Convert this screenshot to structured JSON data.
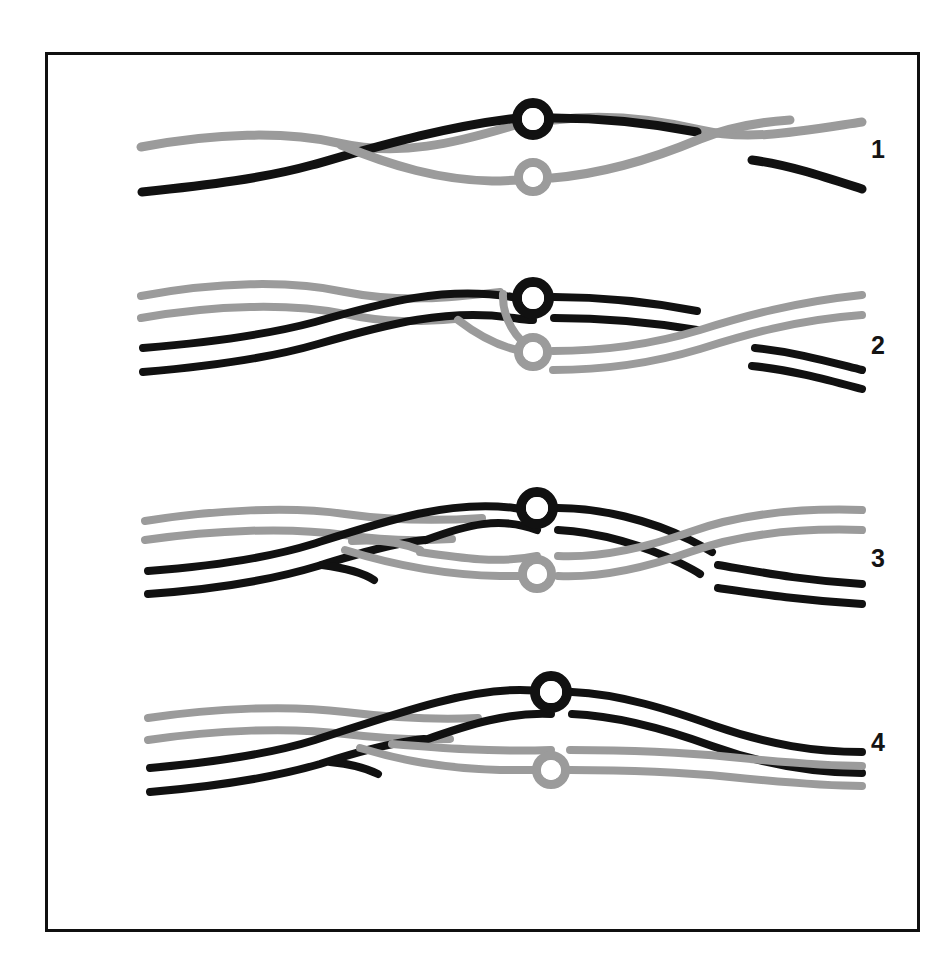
{
  "figure": {
    "background_color": "#ffffff",
    "frame": {
      "border_color": "#101010",
      "border_width_px": 3,
      "x": 45,
      "y": 52,
      "width": 875,
      "height": 880
    },
    "colors": {
      "dark_strand": "#111111",
      "light_strand": "#9b9b9b",
      "node_fill": "#ffffff",
      "label_color": "#141414"
    },
    "stroke_widths": {
      "single_strand": 9,
      "duplex_strand": 8,
      "node_ring": 9
    },
    "row_labels": [
      {
        "id": "1",
        "text": "1"
      },
      {
        "id": "2",
        "text": "2"
      },
      {
        "id": "3",
        "text": "3"
      },
      {
        "id": "4",
        "text": "4"
      }
    ],
    "nodes": [
      {
        "id": "row1-dark-node",
        "color": "dark",
        "cx": 533,
        "cy": 119,
        "r_outer": 21,
        "r_inner": 11
      },
      {
        "id": "row1-light-node",
        "color": "light",
        "cx": 533,
        "cy": 177,
        "r_outer": 19,
        "r_inner": 10
      },
      {
        "id": "row2-dark-node",
        "color": "dark",
        "cx": 533,
        "cy": 298,
        "r_outer": 21,
        "r_inner": 11
      },
      {
        "id": "row2-light-node",
        "color": "light",
        "cx": 533,
        "cy": 352,
        "r_outer": 19,
        "r_inner": 10
      },
      {
        "id": "row3-dark-node",
        "color": "dark",
        "cx": 537,
        "cy": 508,
        "r_outer": 21,
        "r_inner": 11
      },
      {
        "id": "row3-light-node",
        "color": "light",
        "cx": 537,
        "cy": 574,
        "r_outer": 19,
        "r_inner": 10
      },
      {
        "id": "row4-dark-node",
        "color": "dark",
        "cx": 551,
        "cy": 692,
        "r_outer": 21,
        "r_inner": 11
      },
      {
        "id": "row4-light-node",
        "color": "light",
        "cx": 551,
        "cy": 770,
        "r_outer": 19,
        "r_inner": 10
      }
    ],
    "rows": [
      {
        "id": "row-1",
        "label": "1",
        "description": "Two single strands cross; dark strand rises left-to-right, light strand dips; each carries one ring node; dark strand is nicked at right.",
        "paths": [
          {
            "id": "r1-light-a",
            "color": "light",
            "width": 9,
            "d": "M 141 147 C 215 133 285 131 338 143 C 400 157 455 143 512 126 C 520 124 526 122 533 121"
          },
          {
            "id": "r1-light-b",
            "color": "light",
            "width": 9,
            "d": "M 554 120 C 600 114 650 118 700 130 C 748 141 795 132 862 122"
          },
          {
            "id": "r1-dark-a",
            "color": "dark",
            "width": 9,
            "d": "M 142 192 C 210 185 265 178 312 165 C 380 146 440 128 510 119 C 518 118 526 118 533 118"
          },
          {
            "id": "r1-dark-b",
            "color": "dark",
            "width": 9,
            "d": "M 553 118 C 600 118 650 123 697 132"
          },
          {
            "id": "r1-dark-c",
            "color": "dark",
            "width": 9,
            "d": "M 752 160 C 790 165 828 178 862 189"
          },
          {
            "id": "r1-light-cross",
            "color": "light",
            "width": 9,
            "d": "M 341 145 C 392 166 440 180 492 181 C 506 181 520 180 533 179"
          },
          {
            "id": "r1-light-cross-b",
            "color": "light",
            "width": 9,
            "d": "M 552 178 C 600 174 650 160 700 139 C 730 127 760 122 790 120"
          }
        ]
      },
      {
        "id": "row-2",
        "label": "2",
        "description": "Duplex (paired) strands; dark duplex crosses over the light duplex; ring nodes on both duplexes; light duplex truncated at left, dark duplex nicked at right.",
        "paths": [
          {
            "id": "r2-light-a1",
            "color": "light",
            "width": 8,
            "d": "M 141 296 C 215 282 290 280 345 292 C 400 303 450 298 500 292"
          },
          {
            "id": "r2-light-a2",
            "color": "light",
            "width": 8,
            "d": "M 141 318 C 215 305 290 303 345 314 C 385 323 420 322 455 319"
          },
          {
            "id": "r2-dark-a1",
            "color": "dark",
            "width": 8,
            "d": "M 143 348 C 215 342 270 334 315 322 C 385 302 445 286 512 297 C 520 298 527 299 533 299"
          },
          {
            "id": "r2-dark-a2",
            "color": "dark",
            "width": 8,
            "d": "M 143 372 C 215 366 270 358 318 344 C 388 324 448 308 514 318 C 520 319 527 320 533 320"
          },
          {
            "id": "r2-dark-b1",
            "color": "dark",
            "width": 8,
            "d": "M 554 297 C 600 297 650 302 697 311"
          },
          {
            "id": "r2-dark-b2",
            "color": "dark",
            "width": 8,
            "d": "M 554 318 C 600 318 650 322 697 330"
          },
          {
            "id": "r2-dark-c1",
            "color": "dark",
            "width": 8,
            "d": "M 755 348 C 795 352 830 362 862 370"
          },
          {
            "id": "r2-dark-c2",
            "color": "dark",
            "width": 8,
            "d": "M 752 366 C 792 370 828 380 862 389"
          },
          {
            "id": "r2-light-x1",
            "color": "light",
            "width": 8,
            "d": "M 458 320 C 480 337 505 350 533 353"
          },
          {
            "id": "r2-light-x2",
            "color": "light",
            "width": 8,
            "d": "M 503 294 C 502 318 516 340 533 349"
          },
          {
            "id": "r2-light-b1",
            "color": "light",
            "width": 8,
            "d": "M 553 351 C 600 351 650 345 700 330 C 745 316 795 302 862 295"
          },
          {
            "id": "r2-light-b2",
            "color": "light",
            "width": 8,
            "d": "M 553 370 C 600 370 650 364 700 349 C 745 335 795 320 862 315"
          }
        ]
      },
      {
        "id": "row-3",
        "label": "3",
        "description": "Strand exchange intermediate: dark and light duplexes interlock in an elongated lens; dark duplex continues right and is nicked; light duplex emerges on upper right.",
        "paths": [
          {
            "id": "r3-light-a1",
            "color": "light",
            "width": 8,
            "d": "M 145 521 C 215 510 290 506 345 514 C 395 521 440 521 482 518"
          },
          {
            "id": "r3-light-a2",
            "color": "light",
            "width": 8,
            "d": "M 145 540 C 215 530 290 527 345 535 C 385 541 420 541 452 539"
          },
          {
            "id": "r3-dark-a1",
            "color": "dark",
            "width": 8,
            "d": "M 148 571 C 215 566 268 558 313 544 C 385 521 448 500 514 508 C 521 509 528 510 537 510"
          },
          {
            "id": "r3-dark-a2",
            "color": "dark",
            "width": 8,
            "d": "M 148 594 C 218 589 272 580 318 566 C 360 553 395 543 425 540"
          },
          {
            "id": "r3-dark-lens-top",
            "color": "dark",
            "width": 8,
            "d": "M 426 540 C 466 525 500 516 537 530"
          },
          {
            "id": "r3-dark-nick",
            "color": "dark",
            "width": 8,
            "d": "M 322 565 C 345 568 362 572 374 580"
          },
          {
            "id": "r3-light-lens-top",
            "color": "light",
            "width": 8,
            "d": "M 352 541 C 380 539 400 542 420 550"
          },
          {
            "id": "r3-light-x1",
            "color": "light",
            "width": 8,
            "d": "M 345 550 C 390 564 440 575 500 576 C 512 576 526 576 537 576"
          },
          {
            "id": "r3-light-lens-bot",
            "color": "light",
            "width": 8,
            "d": "M 420 552 C 460 558 500 564 537 556"
          },
          {
            "id": "r3-dark-b1",
            "color": "dark",
            "width": 8,
            "d": "M 558 508 C 600 508 650 520 690 540 C 700 545 705 548 712 552"
          },
          {
            "id": "r3-dark-b2",
            "color": "dark",
            "width": 8,
            "d": "M 558 530 C 600 532 645 546 680 563 C 690 568 696 571 700 574"
          },
          {
            "id": "r3-dark-c1",
            "color": "dark",
            "width": 8,
            "d": "M 718 565 C 760 572 800 580 862 584"
          },
          {
            "id": "r3-dark-c2",
            "color": "dark",
            "width": 8,
            "d": "M 718 588 C 760 594 800 600 862 604"
          },
          {
            "id": "r3-light-b1",
            "color": "light",
            "width": 8,
            "d": "M 558 556 C 600 558 645 548 690 532 C 740 514 800 508 862 510"
          },
          {
            "id": "r3-light-b2",
            "color": "light",
            "width": 8,
            "d": "M 558 576 C 600 578 645 568 690 552 C 740 534 800 528 862 530"
          }
        ]
      },
      {
        "id": "row-4",
        "label": "4",
        "description": "Resolved recombinant products: dark duplex above with ring node, light duplex below with ring node; both run uninterrupted to the right edge.",
        "paths": [
          {
            "id": "r4-light-a1",
            "color": "light",
            "width": 8,
            "d": "M 148 718 C 215 708 290 705 345 712 C 395 718 440 720 478 718"
          },
          {
            "id": "r4-light-a2",
            "color": "light",
            "width": 8,
            "d": "M 148 740 C 215 730 290 727 345 734 C 385 739 420 740 450 739"
          },
          {
            "id": "r4-dark-a1",
            "color": "dark",
            "width": 8,
            "d": "M 150 768 C 218 762 270 754 315 740 C 390 716 460 690 520 690 C 530 690 542 691 551 692"
          },
          {
            "id": "r4-dark-a2",
            "color": "dark",
            "width": 8,
            "d": "M 150 792 C 220 786 272 778 320 764 C 360 751 395 742 424 739"
          },
          {
            "id": "r4-dark-lens",
            "color": "dark",
            "width": 8,
            "d": "M 425 740 C 470 724 510 712 551 714"
          },
          {
            "id": "r4-dark-nick",
            "color": "dark",
            "width": 8,
            "d": "M 330 762 C 352 764 366 768 378 774"
          },
          {
            "id": "r4-light-x1",
            "color": "light",
            "width": 8,
            "d": "M 360 748 C 400 760 440 768 500 770 C 516 770 536 770 551 770"
          },
          {
            "id": "r4-light-lens",
            "color": "light",
            "width": 8,
            "d": "M 392 744 C 440 748 490 752 551 750"
          },
          {
            "id": "r4-dark-b1",
            "color": "dark",
            "width": 8,
            "d": "M 572 692 C 620 694 670 710 715 726 C 770 745 815 752 862 752"
          },
          {
            "id": "r4-dark-b2",
            "color": "dark",
            "width": 8,
            "d": "M 572 714 C 620 716 668 730 712 746 C 768 766 815 773 862 773"
          },
          {
            "id": "r4-light-b1",
            "color": "light",
            "width": 8,
            "d": "M 570 750 C 620 750 680 752 730 757 C 790 763 825 766 862 766"
          },
          {
            "id": "r4-light-b2",
            "color": "light",
            "width": 8,
            "d": "M 570 770 C 620 770 680 772 730 777 C 790 783 825 786 862 786"
          }
        ]
      }
    ]
  }
}
